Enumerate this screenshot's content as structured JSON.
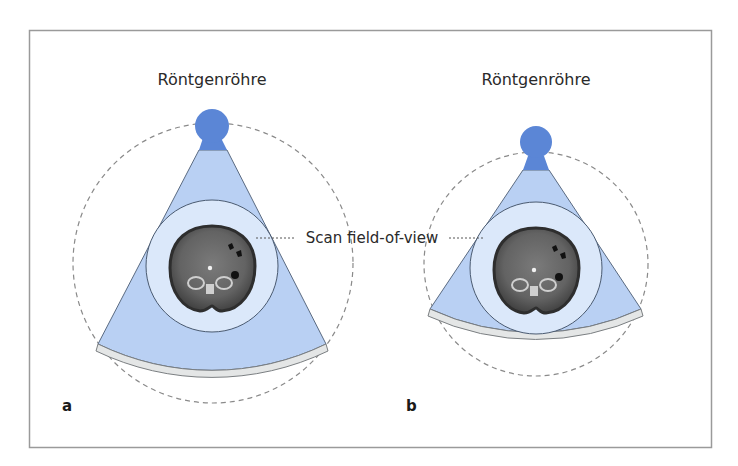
{
  "figure": {
    "panels": [
      {
        "id": "a",
        "panel_label": "a",
        "tube_label": "Röntgenröhre"
      },
      {
        "id": "b",
        "panel_label": "b",
        "tube_label": "Röntgenröhre"
      }
    ],
    "shared_annotation": "Scan field-of-view",
    "colors": {
      "frame": "#9a9a9a",
      "tube": "#5b86d6",
      "beam_fan": "#b9d0f3",
      "beam_fan_neck": "#5b86d6",
      "fan_outline": "#5a6a80",
      "scan_fov_fill": "#dbe8fa",
      "scan_fov_stroke": "#4a5a70",
      "detector_fill": "#e4e6e6",
      "detector_stroke": "#7b7f82",
      "dashed_orbit": "#8a8a8a",
      "ct_body": "#5d5d5d",
      "ct_rim": "#2e2e2e",
      "text": "#2a2a2a"
    }
  }
}
